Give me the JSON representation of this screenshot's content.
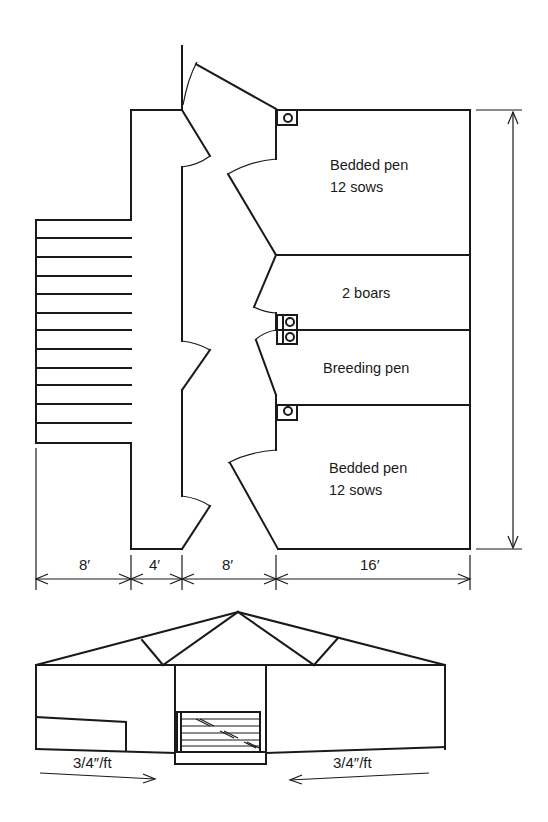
{
  "figure": {
    "plan_view": {
      "pens": [
        {
          "label_line1": "Bedded pen",
          "label_line2": "12 sows"
        },
        {
          "label_line1": "2 boars"
        },
        {
          "label_line1": "Breeding pen"
        },
        {
          "label_line1": "Bedded pen",
          "label_line2": "12 sows"
        }
      ],
      "dimensions": {
        "widths": [
          "8′",
          "4′",
          "8′",
          "16′"
        ]
      },
      "icons": {
        "waterer": "waterer-icon",
        "stairs": "stairs-icon",
        "gate": "gate-icon"
      }
    },
    "elevation_view": {
      "slope_labels": {
        "left": "3/4″/ft",
        "right": "3/4″/ft"
      }
    }
  }
}
